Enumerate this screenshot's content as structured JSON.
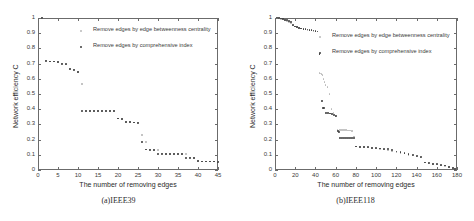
{
  "figure": {
    "background": "#ffffff",
    "series_colors": {
      "betweenness": "#b9b9b9",
      "comprehensive": "#3d3d3d"
    },
    "axis_color": "#6b6b6b"
  },
  "legend": {
    "entries": [
      {
        "label": "Remove edges by edge betweenness centrality",
        "color": "#b9b9b9"
      },
      {
        "label": "Remove edges by comprehensive index",
        "color": "#3d3d3d"
      }
    ]
  },
  "panels": [
    {
      "key": "a",
      "caption": "(a)IEEE39"
    },
    {
      "key": "b",
      "caption": "(b)IEEE118"
    }
  ],
  "chart_data": [
    {
      "type": "scatter",
      "panel": "(a)IEEE39",
      "title": "",
      "xlabel": "The number of removing edges",
      "ylabel": "Network efficiency C",
      "xlim": [
        0,
        45
      ],
      "ylim": [
        0,
        1
      ],
      "xticks": [
        0,
        5,
        10,
        15,
        20,
        25,
        30,
        35,
        40,
        45
      ],
      "yticks": [
        0,
        0.1,
        0.2,
        0.3,
        0.4,
        0.5,
        0.6,
        0.7,
        0.8,
        0.9,
        1
      ],
      "grid": false,
      "legend_position": "upper-center",
      "series": [
        {
          "name": "Remove edges by edge betweenness centrality",
          "color": "#b9b9b9",
          "x": [
            1,
            2,
            3,
            4,
            5,
            6,
            7,
            8,
            9,
            10,
            11,
            12,
            13,
            14,
            15,
            16,
            17,
            18,
            19,
            20,
            21,
            22,
            23,
            24,
            25,
            26,
            27,
            28,
            29,
            30,
            31,
            32,
            33,
            34,
            35,
            36,
            37,
            38,
            39,
            40,
            41,
            42,
            43,
            44,
            45
          ],
          "y": [
            1.0,
            0.72,
            0.715,
            0.715,
            0.712,
            0.7,
            0.695,
            0.665,
            0.66,
            0.645,
            0.565,
            0.39,
            0.39,
            0.39,
            0.388,
            0.388,
            0.388,
            0.387,
            0.387,
            0.34,
            0.335,
            0.315,
            0.315,
            0.313,
            0.313,
            0.232,
            0.185,
            0.135,
            0.133,
            0.131,
            0.108,
            0.107,
            0.107,
            0.106,
            0.106,
            0.105,
            0.105,
            0.082,
            0.08,
            0.058,
            0.057,
            0.057,
            0.056,
            0.056,
            0.055
          ]
        },
        {
          "name": "Remove edges by comprehensive index",
          "color": "#3d3d3d",
          "x": [
            1,
            2,
            3,
            4,
            5,
            6,
            7,
            8,
            9,
            10,
            11,
            12,
            13,
            14,
            15,
            16,
            17,
            18,
            19,
            20,
            21,
            22,
            23,
            24,
            25,
            26,
            27,
            28,
            29,
            30,
            31,
            32,
            33,
            34,
            35,
            36,
            37,
            38,
            39,
            40,
            41,
            42,
            43,
            44,
            45
          ],
          "y": [
            1.0,
            0.72,
            0.715,
            0.714,
            0.712,
            0.7,
            0.698,
            0.665,
            0.66,
            0.645,
            0.39,
            0.39,
            0.39,
            0.389,
            0.388,
            0.388,
            0.388,
            0.387,
            0.387,
            0.34,
            0.335,
            0.315,
            0.315,
            0.313,
            0.312,
            0.185,
            0.135,
            0.133,
            0.132,
            0.108,
            0.107,
            0.107,
            0.106,
            0.106,
            0.105,
            0.105,
            0.082,
            0.08,
            0.079,
            0.058,
            0.057,
            0.057,
            0.056,
            0.056,
            0.055
          ]
        }
      ]
    },
    {
      "type": "scatter",
      "panel": "(b)IEEE118",
      "title": "",
      "xlabel": "The number of removing edges",
      "ylabel": "Network efficiency C",
      "xlim": [
        0,
        180
      ],
      "ylim": [
        0,
        1
      ],
      "xticks": [
        0,
        20,
        40,
        60,
        80,
        100,
        120,
        140,
        160,
        180
      ],
      "yticks": [
        0,
        0.1,
        0.2,
        0.3,
        0.4,
        0.5,
        0.6,
        0.7,
        0.8,
        0.9,
        1
      ],
      "grid": false,
      "legend_position": "upper-center",
      "series": [
        {
          "name": "Remove edges by edge betweenness centrality",
          "color": "#b9b9b9",
          "x": [
            2,
            4,
            6,
            8,
            10,
            12,
            14,
            16,
            18,
            20,
            22,
            24,
            26,
            28,
            30,
            32,
            34,
            36,
            38,
            40,
            42,
            44,
            45,
            46,
            47,
            48,
            49,
            50,
            52,
            54,
            56,
            58,
            60,
            62,
            64,
            66,
            68,
            70,
            72,
            74,
            76,
            78,
            80,
            84,
            88,
            92,
            96,
            100,
            104,
            108,
            112,
            116,
            120,
            124,
            128,
            132,
            136,
            140,
            144,
            148,
            152,
            156,
            160,
            164,
            168,
            172,
            176,
            178
          ],
          "y": [
            1.0,
            1.0,
            0.995,
            0.99,
            0.985,
            0.98,
            0.975,
            0.965,
            0.95,
            0.945,
            0.94,
            0.935,
            0.93,
            0.928,
            0.925,
            0.922,
            0.92,
            0.918,
            0.915,
            0.912,
            0.91,
            0.64,
            0.635,
            0.63,
            0.625,
            0.6,
            0.58,
            0.56,
            0.545,
            0.5,
            0.4,
            0.375,
            0.355,
            0.265,
            0.265,
            0.264,
            0.263,
            0.262,
            0.26,
            0.26,
            0.258,
            0.22,
            0.155,
            0.152,
            0.15,
            0.148,
            0.145,
            0.142,
            0.14,
            0.135,
            0.128,
            0.122,
            0.118,
            0.112,
            0.108,
            0.1,
            0.095,
            0.09,
            0.082,
            0.05,
            0.045,
            0.04,
            0.035,
            0.03,
            0.028,
            0.02,
            0.012,
            0.008
          ]
        },
        {
          "name": "Remove edges by comprehensive index",
          "color": "#3d3d3d",
          "x": [
            2,
            4,
            6,
            8,
            10,
            12,
            14,
            16,
            18,
            20,
            22,
            24,
            26,
            28,
            30,
            32,
            34,
            36,
            38,
            40,
            42,
            44,
            46,
            47,
            48,
            50,
            52,
            54,
            56,
            58,
            60,
            62,
            63,
            64,
            66,
            68,
            70,
            72,
            74,
            76,
            78,
            80,
            84,
            88,
            92,
            96,
            100,
            104,
            108,
            112,
            116,
            120,
            124,
            128,
            132,
            136,
            140,
            144,
            148,
            152,
            156,
            160,
            164,
            168,
            172,
            176,
            178
          ],
          "y": [
            1.0,
            1.0,
            0.998,
            0.995,
            0.99,
            0.985,
            0.98,
            0.972,
            0.955,
            0.945,
            0.94,
            0.935,
            0.932,
            0.93,
            0.928,
            0.925,
            0.922,
            0.92,
            0.918,
            0.915,
            0.912,
            0.765,
            0.455,
            0.41,
            0.408,
            0.378,
            0.375,
            0.372,
            0.368,
            0.36,
            0.355,
            0.255,
            0.252,
            0.213,
            0.212,
            0.212,
            0.211,
            0.21,
            0.21,
            0.21,
            0.21,
            0.155,
            0.152,
            0.15,
            0.15,
            0.148,
            0.145,
            0.142,
            0.14,
            0.138,
            0.13,
            0.122,
            0.118,
            0.112,
            0.108,
            0.1,
            0.092,
            0.085,
            0.05,
            0.046,
            0.042,
            0.038,
            0.032,
            0.03,
            0.022,
            0.014,
            0.008
          ]
        }
      ]
    }
  ]
}
